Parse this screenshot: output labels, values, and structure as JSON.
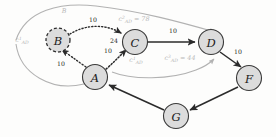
{
  "diagram": {
    "colors": {
      "node_fill": "#dcdcdc",
      "node_stroke": "#3a3a3a",
      "edge_solid": "#2b2b2b",
      "edge_dotted": "#2b2b2b",
      "annotation_gray": "#b2b2b2",
      "background": "#fdfdfc"
    },
    "nodes": [
      {
        "id": "A",
        "label": "A",
        "cx": 95,
        "cy": 77,
        "r": 12.5,
        "style": "solid"
      },
      {
        "id": "B",
        "label": "B",
        "cx": 58,
        "cy": 40,
        "r": 12.0,
        "style": "dashed"
      },
      {
        "id": "C",
        "label": "C",
        "cx": 135,
        "cy": 42,
        "r": 12.5,
        "style": "solid"
      },
      {
        "id": "D",
        "label": "D",
        "cx": 211,
        "cy": 42,
        "r": 12.5,
        "style": "solid"
      },
      {
        "id": "F",
        "label": "F",
        "cx": 249,
        "cy": 78,
        "r": 12.5,
        "style": "solid"
      },
      {
        "id": "G",
        "label": "G",
        "cx": 176,
        "cy": 116,
        "r": 12.5,
        "style": "solid"
      }
    ],
    "edges": [
      {
        "from": "B",
        "to": "C",
        "style": "dotted",
        "weight": "10",
        "weight_x": 93,
        "weight_y": 22
      },
      {
        "from": "A",
        "to": "B",
        "style": "dotted",
        "weight": "10",
        "weight_x": 61,
        "weight_y": 66
      },
      {
        "from": "A",
        "to": "C",
        "style": "dotted",
        "weight": "10",
        "weight_x": 108,
        "weight_y": 53
      },
      {
        "from": "C",
        "to": "D",
        "style": "solid",
        "weight": "10",
        "weight_x": 173,
        "weight_y": 33
      },
      {
        "from": "D",
        "to": "F",
        "style": "solid",
        "weight": "10",
        "weight_x": 238,
        "weight_y": 54
      },
      {
        "from": "F",
        "to": "G",
        "style": "solid",
        "weight": "",
        "weight_x": 0,
        "weight_y": 0
      },
      {
        "from": "G",
        "to": "A",
        "style": "solid",
        "weight": "",
        "weight_x": 0,
        "weight_y": 0
      }
    ],
    "inbound_weight_label": {
      "text": "24",
      "x": 114,
      "y": 43
    },
    "annotations": [
      {
        "id": "c1-ad-left",
        "base": "c",
        "superscript": "1",
        "subscript": "AD",
        "suffix": "",
        "x": 22,
        "y": 42,
        "color": "#b8b8b8"
      },
      {
        "id": "c2-ad-top",
        "base": "c",
        "superscript": "2",
        "subscript": "AD",
        "suffix": " = 78",
        "x": 134,
        "y": 21,
        "color": "#b8b8b8"
      },
      {
        "id": "c1-ad-mid",
        "base": "c",
        "superscript": "1",
        "subscript": "AD",
        "suffix": "",
        "x": 136,
        "y": 62,
        "color": "#b8b8b8"
      },
      {
        "id": "c3-ad-mid",
        "base": "c",
        "superscript": "3",
        "subscript": "AD",
        "suffix": " = 44",
        "x": 180,
        "y": 60,
        "color": "#b8b8b8"
      },
      {
        "id": "b-marker-top",
        "base": "B",
        "superscript": "",
        "subscript": "",
        "suffix": "",
        "x": 64,
        "y": 13,
        "color": "#9a9a9a"
      }
    ]
  }
}
